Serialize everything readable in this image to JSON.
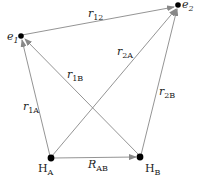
{
  "diagram": {
    "nodes": [
      {
        "id": "e1",
        "label": "e",
        "sub": "1",
        "x": 21,
        "y": 36
      },
      {
        "id": "e2",
        "label": "e",
        "sub": "2",
        "x": 178,
        "y": 5
      },
      {
        "id": "HA",
        "label": "H",
        "sub": "A",
        "x": 51,
        "y": 158
      },
      {
        "id": "HB",
        "label": "H",
        "sub": "B",
        "x": 140,
        "y": 157
      }
    ],
    "edges": [
      {
        "id": "r12",
        "label": "r",
        "sub": "12",
        "from": "e1",
        "to": "e2"
      },
      {
        "id": "r1A",
        "label": "r",
        "sub": "1A",
        "from": "HA",
        "to": "e1"
      },
      {
        "id": "r1B",
        "label": "r",
        "sub": "1B",
        "from": "HB",
        "to": "e1"
      },
      {
        "id": "r2A",
        "label": "r",
        "sub": "2A",
        "from": "HA",
        "to": "e2"
      },
      {
        "id": "r2B",
        "label": "r",
        "sub": "2B",
        "from": "HB",
        "to": "e2"
      },
      {
        "id": "RAB",
        "label": "R",
        "sub": "AB",
        "from": "HA",
        "to": "HB"
      }
    ],
    "colors": {
      "line": "#888888",
      "node": "#000000",
      "text": "#222222"
    }
  }
}
